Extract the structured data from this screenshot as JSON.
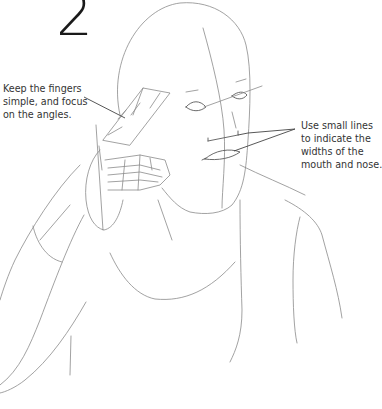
{
  "step": {
    "number": "2"
  },
  "annotations": [
    {
      "id": "fingers-tip",
      "lines": [
        "Keep the fingers",
        "simple, and focus",
        "on the angles."
      ]
    },
    {
      "id": "mouth-nose-tip",
      "lines": [
        "Use small lines",
        "to indicate the",
        "widths of the",
        "mouth and nose."
      ]
    }
  ],
  "illustration": {
    "subject": "figure-sketch-hand-to-face",
    "stroke_color": "#8a8a8a",
    "leader_color": "#444444",
    "text_color": "#333333"
  }
}
